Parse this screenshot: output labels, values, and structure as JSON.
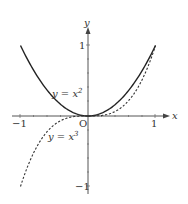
{
  "diagram": {
    "type": "function-graph",
    "axes": {
      "x_label": "x",
      "y_label": "y",
      "origin_label": "O",
      "x_ticks": [
        "−1",
        "1"
      ],
      "y_ticks": [
        "1",
        "−1"
      ]
    },
    "curves": [
      {
        "name": "parabola",
        "label_prefix": "y = x",
        "exponent": "2",
        "style": "solid"
      },
      {
        "name": "cubic",
        "label_prefix": "y = x",
        "exponent": "3",
        "style": "dashed"
      }
    ]
  }
}
